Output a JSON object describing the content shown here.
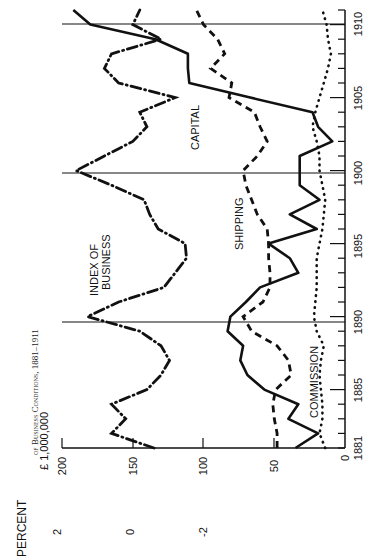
{
  "page": {
    "running_header": "of Business Conditions, 1881–1911"
  },
  "axes": {
    "left_axis_title": "PERCENT",
    "left_axis_ticks": [
      "2",
      "0",
      "-2"
    ],
    "unit_label": "£ 1,000,000",
    "value_ticks": [
      "200",
      "150",
      "100",
      "50",
      "0"
    ],
    "year_ticks": [
      "1881",
      "1885",
      "1890",
      "1895",
      "1900",
      "1905",
      "1910"
    ]
  },
  "series_labels": {
    "index": "INDEX OF",
    "index2": "BUSINESS",
    "capital": "CAPITAL",
    "shipping": "SHIPPING",
    "commission": "COMMISSION"
  },
  "chart_data": {
    "type": "line",
    "title": "of Business Conditions, 1881–1911",
    "orientation": "rotated 90° counter-clockwise (years run bottom to top, values run right to left)",
    "xlabel": "Year",
    "ylabel": "£ 1,000,000",
    "secondary_ylabel": "PERCENT",
    "secondary_ticks": [
      2,
      0,
      -2
    ],
    "xlim": [
      1881,
      1911
    ],
    "ylim": [
      0,
      200
    ],
    "x_ticks": [
      1881,
      1885,
      1890,
      1895,
      1900,
      1905,
      1910
    ],
    "y_ticks": [
      0,
      50,
      100,
      150,
      200
    ],
    "grid": "vertical reference lines at 1890, 1900, 1910",
    "legend": "inline labels",
    "x": [
      1881,
      1882,
      1883,
      1884,
      1885,
      1886,
      1887,
      1888,
      1889,
      1890,
      1891,
      1892,
      1893,
      1894,
      1895,
      1896,
      1897,
      1898,
      1899,
      1900,
      1901,
      1902,
      1903,
      1904,
      1905,
      1906,
      1907,
      1908,
      1909,
      1910,
      1911
    ],
    "series": [
      {
        "name": "CAPITAL",
        "style": "solid",
        "values": [
          35,
          19,
          40,
          33,
          57,
          69,
          74,
          72,
          83,
          81,
          70,
          60,
          33,
          39,
          54,
          20,
          39,
          18,
          32,
          32,
          32,
          9,
          19,
          23,
          67,
          110,
          111,
          111,
          134,
          180,
          192
        ]
      },
      {
        "name": "SHIPPING",
        "style": "dashed",
        "values": [
          48,
          48,
          50,
          51,
          49,
          38,
          40,
          48,
          66,
          72,
          58,
          53,
          53,
          54,
          54,
          55,
          62,
          66,
          70,
          72,
          62,
          55,
          60,
          64,
          82,
          80,
          95,
          85,
          90,
          100,
          105
        ]
      },
      {
        "name": "COMMISSION",
        "style": "dotted",
        "values": [
          14,
          18,
          16,
          16,
          17,
          18,
          17,
          15,
          20,
          22,
          21,
          20,
          20,
          20,
          18,
          16,
          15,
          14,
          16,
          18,
          18,
          20,
          23,
          21,
          18,
          15,
          12,
          10,
          12,
          13,
          16
        ]
      },
      {
        "name": "INDEX OF BUSINESS",
        "style": "dash-dot",
        "values": [
          135,
          165,
          155,
          165,
          140,
          130,
          124,
          130,
          145,
          182,
          160,
          128,
          120,
          112,
          113,
          132,
          138,
          142,
          165,
          190,
          170,
          150,
          140,
          145,
          120,
          160,
          170,
          165,
          130,
          150,
          145
        ]
      }
    ]
  }
}
